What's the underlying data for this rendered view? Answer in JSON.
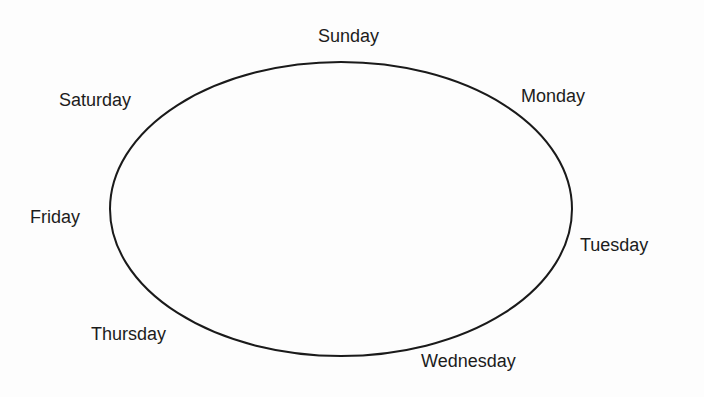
{
  "diagram": {
    "type": "cyclic-weekday-ring",
    "shape": "ellipse",
    "ellipse": {
      "cx": 341,
      "cy": 209,
      "rx": 231,
      "ry": 147,
      "stroke": "#1a1a1a",
      "stroke_width": 2
    },
    "labels": [
      {
        "id": "sunday",
        "text": "Sunday",
        "x": 318,
        "y": 26
      },
      {
        "id": "monday",
        "text": "Monday",
        "x": 521,
        "y": 86
      },
      {
        "id": "tuesday",
        "text": "Tuesday",
        "x": 580,
        "y": 235
      },
      {
        "id": "wednesday",
        "text": "Wednesday",
        "x": 421,
        "y": 351
      },
      {
        "id": "thursday",
        "text": "Thursday",
        "x": 91,
        "y": 324
      },
      {
        "id": "friday",
        "text": "Friday",
        "x": 30,
        "y": 207
      },
      {
        "id": "saturday",
        "text": "Saturday",
        "x": 59,
        "y": 90
      }
    ],
    "order": [
      "Sunday",
      "Monday",
      "Tuesday",
      "Wednesday",
      "Thursday",
      "Friday",
      "Saturday"
    ]
  }
}
